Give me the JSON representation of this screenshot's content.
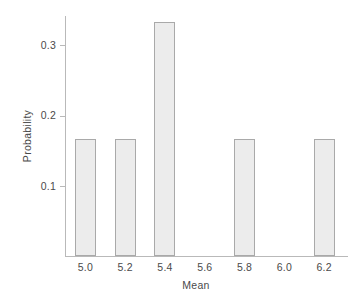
{
  "chart_data": {
    "type": "bar",
    "title": "",
    "subtitle": "",
    "xlabel": "Mean",
    "ylabel": "Probability",
    "categories": [
      "5.0",
      "5.2",
      "5.4",
      "5.6",
      "5.8",
      "6.0",
      "6.2"
    ],
    "values": [
      0.1667,
      0.1667,
      0.3333,
      0,
      0.1667,
      0,
      0.1667
    ],
    "x_tick_labels": [
      "5.0",
      "5.2",
      "5.4",
      "5.6",
      "5.8",
      "6.0",
      "6.2"
    ],
    "y_tick_labels": [
      "0.1",
      "0.2",
      "0.3"
    ],
    "y_tick_values": [
      0.1,
      0.2,
      0.3
    ],
    "xlim": [
      4.9,
      6.32
    ],
    "ylim": [
      0,
      0.3475
    ],
    "grid": false,
    "legend": false,
    "legend_position": "none",
    "annotations": [],
    "style": {
      "bar_fill": "#ececec",
      "bar_edge": "#a9a9a9",
      "axis_color": "#b9b9b9",
      "text_color": "#4a4a4a",
      "background": "#ffffff"
    }
  },
  "axes": {
    "y_title": "Probability",
    "x_title": "Mean",
    "y_ticks": [
      {
        "label": "0.1",
        "value": 0.1
      },
      {
        "label": "0.2",
        "value": 0.2
      },
      {
        "label": "0.3",
        "value": 0.3
      }
    ],
    "x_ticks": [
      {
        "label": "5.0",
        "value": 5.0
      },
      {
        "label": "5.2",
        "value": 5.2
      },
      {
        "label": "5.4",
        "value": 5.4
      },
      {
        "label": "5.6",
        "value": 5.6
      },
      {
        "label": "5.8",
        "value": 5.8
      },
      {
        "label": "6.0",
        "value": 6.0
      },
      {
        "label": "6.2",
        "value": 6.2
      }
    ]
  },
  "bars": [
    {
      "category": "5.0",
      "value": 0.1667
    },
    {
      "category": "5.2",
      "value": 0.1667
    },
    {
      "category": "5.4",
      "value": 0.3333
    },
    {
      "category": "5.6",
      "value": 0
    },
    {
      "category": "5.8",
      "value": 0.1667
    },
    {
      "category": "6.0",
      "value": 0
    },
    {
      "category": "6.2",
      "value": 0.1667
    }
  ]
}
